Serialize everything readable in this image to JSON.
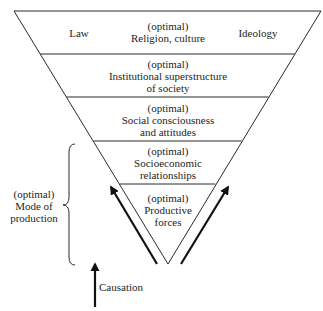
{
  "diagram": {
    "type": "inverted-pyramid",
    "layers": [
      {
        "id": "superstructure-top",
        "lines": [
          "(optimal)",
          "Religion, culture"
        ],
        "side_labels": {
          "left": "Law",
          "right": "Ideology"
        }
      },
      {
        "id": "institutional-superstructure",
        "lines": [
          "(optimal)",
          "Institutional superstructure",
          "of society"
        ]
      },
      {
        "id": "social-consciousness",
        "lines": [
          "(optimal)",
          "Social consciousness",
          "and attitudes"
        ]
      },
      {
        "id": "socioeconomic-relationships",
        "lines": [
          "(optimal)",
          "Socioeconomic",
          "relationships"
        ]
      },
      {
        "id": "productive-forces",
        "lines": [
          "(optimal)",
          "Productive",
          "forces"
        ]
      }
    ],
    "brace_label": {
      "lines": [
        "(optimal)",
        "Mode of",
        "production"
      ],
      "spans_layers": [
        "socioeconomic-relationships",
        "productive-forces"
      ]
    },
    "legend": {
      "arrow_label": "Causation"
    },
    "colors": {
      "stroke": "#2a2a2a",
      "text": "#1e1e1e",
      "arrow": "#111111",
      "background": "#ffffff"
    }
  }
}
